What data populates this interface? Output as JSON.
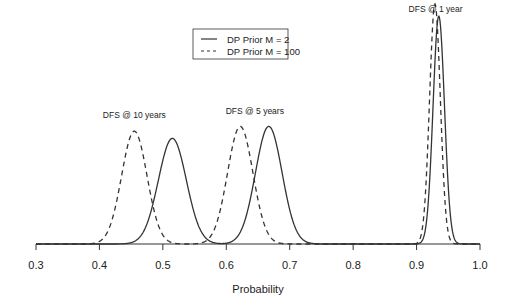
{
  "chart_data": {
    "type": "line",
    "title": "",
    "xlabel": "Probability",
    "ylabel": "",
    "xlim": [
      0.3,
      1.0
    ],
    "xticks": [
      "0.3",
      "0.4",
      "0.5",
      "0.6",
      "0.7",
      "0.8",
      "0.9",
      "1.0"
    ],
    "grid": false,
    "legend_position": "top-center",
    "legend": [
      "DP Prior M = 2",
      "DP Prior M = 100"
    ],
    "annotations": [
      "DFS @ 10 years",
      "DFS @ 5 years",
      "DFS @ 1 year"
    ],
    "series": [
      {
        "name": "DP Prior M = 2",
        "style": "solid",
        "curves": [
          {
            "label": "DFS @ 10 years",
            "mean": 0.515,
            "sd": 0.022,
            "peak_rel": 0.44
          },
          {
            "label": "DFS @ 5 years",
            "mean": 0.667,
            "sd": 0.021,
            "peak_rel": 0.49
          },
          {
            "label": "DFS @ 1 year",
            "mean": 0.935,
            "sd": 0.009,
            "peak_rel": 0.95
          }
        ]
      },
      {
        "name": "DP Prior M = 100",
        "style": "dashed",
        "curves": [
          {
            "label": "DFS @ 10 years",
            "mean": 0.455,
            "sd": 0.02,
            "peak_rel": 0.47
          },
          {
            "label": "DFS @ 5 years",
            "mean": 0.622,
            "sd": 0.02,
            "peak_rel": 0.49
          },
          {
            "label": "DFS @ 1 year",
            "mean": 0.929,
            "sd": 0.0085,
            "peak_rel": 1.0
          }
        ]
      }
    ]
  }
}
